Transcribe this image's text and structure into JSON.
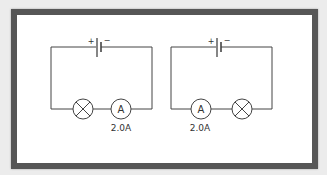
{
  "figure": {
    "colors": {
      "frame": "#565656",
      "background": "#ffffff",
      "outer": "#ececec",
      "line": "#444444"
    }
  },
  "circuits": [
    {
      "name": "left",
      "battery": {
        "positive_label": "+",
        "negative_label": "−"
      },
      "order": [
        "lamp",
        "ammeter"
      ],
      "ammeter": {
        "symbol": "A",
        "reading": "2.0A"
      }
    },
    {
      "name": "right",
      "battery": {
        "positive_label": "+",
        "negative_label": "−"
      },
      "order": [
        "ammeter",
        "lamp"
      ],
      "ammeter": {
        "symbol": "A",
        "reading": "2.0A"
      }
    }
  ]
}
